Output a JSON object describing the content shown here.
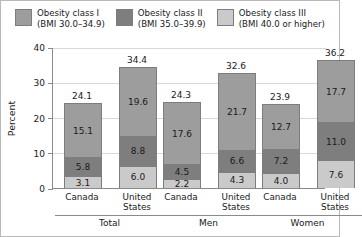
{
  "chart_data": {
    "type": "bar",
    "subtype": "stacked-grouped",
    "title": "",
    "xlabel": "",
    "ylabel": "Percent",
    "ylim": [
      0,
      40
    ],
    "yticks": [
      0,
      10,
      20,
      30,
      40
    ],
    "ytick_labels": [
      "0",
      "10",
      "20",
      "30",
      "40"
    ],
    "grid": true,
    "grid_axis": "y",
    "legend_position": "top",
    "legend": [
      {
        "name": "Obesity class I",
        "detail": "(BMI 30.0–34.9)",
        "color": "#9d9d9d"
      },
      {
        "name": "Obesity class II",
        "detail": "(BMI 35.0–39.9)",
        "color": "#7e7e7e"
      },
      {
        "name": "Obesity class III",
        "detail": "(BMI 40.0 or higher)",
        "color": "#cacaca"
      }
    ],
    "series": [
      {
        "name": "Obesity class I",
        "values": [
          15.1,
          19.6,
          17.6,
          21.7,
          12.7,
          17.7
        ]
      },
      {
        "name": "Obesity class II",
        "values": [
          5.8,
          8.8,
          4.5,
          6.6,
          7.2,
          11.0
        ]
      },
      {
        "name": "Obesity class III",
        "values": [
          3.1,
          6.0,
          2.2,
          4.3,
          4.0,
          7.6
        ]
      }
    ],
    "categories": [
      "Canada",
      "United States",
      "Canada",
      "United States",
      "Canada",
      "United States"
    ],
    "totals": [
      24.1,
      34.4,
      24.3,
      32.6,
      23.9,
      36.2
    ],
    "groups": [
      {
        "label": "Total",
        "categories": [
          "Canada",
          "United States"
        ]
      },
      {
        "label": "Men",
        "categories": [
          "Canada",
          "United States"
        ]
      },
      {
        "label": "Women",
        "categories": [
          "Canada",
          "United States"
        ]
      }
    ],
    "bars": [
      {
        "group": "Total",
        "country": "Canada",
        "total": "24.1",
        "class_i": "15.1",
        "class_ii": "5.8",
        "class_iii": "3.1"
      },
      {
        "group": "Total",
        "country": "United States",
        "total": "34.4",
        "class_i": "19.6",
        "class_ii": "8.8",
        "class_iii": "6.0"
      },
      {
        "group": "Men",
        "country": "Canada",
        "total": "24.3",
        "class_i": "17.6",
        "class_ii": "4.5",
        "class_iii": "2.2"
      },
      {
        "group": "Men",
        "country": "United States",
        "total": "32.6",
        "class_i": "21.7",
        "class_ii": "6.6",
        "class_iii": "4.3"
      },
      {
        "group": "Women",
        "country": "Canada",
        "total": "23.9",
        "class_i": "12.7",
        "class_ii": "7.2",
        "class_iii": "4.0"
      },
      {
        "group": "Women",
        "country": "United States",
        "total": "36.2",
        "class_i": "17.7",
        "class_ii": "11.0",
        "class_iii": "7.6"
      }
    ]
  },
  "axis": {
    "y_title": "Percent",
    "ticks": [
      "40",
      "30",
      "20",
      "10",
      "0"
    ]
  },
  "colors": {
    "class_i": "#9d9d9d",
    "class_ii": "#7e7e7e",
    "class_iii": "#cacaca",
    "axis": "#8a8a8a",
    "grid": "#d8d8d8",
    "text": "#1a1a1a"
  }
}
